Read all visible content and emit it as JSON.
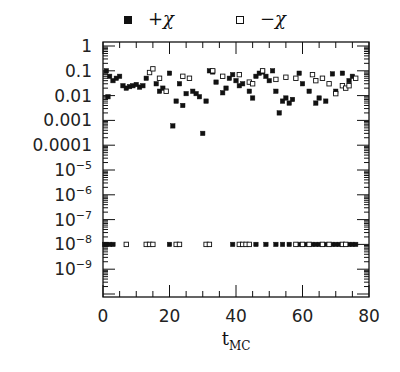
{
  "chart_data": {
    "type": "scatter",
    "title": "",
    "xlabel": "t_MC",
    "ylabel": "",
    "xlim": [
      0,
      80
    ],
    "ylim_log10": [
      -10.15,
      0.15
    ],
    "yscale": "log",
    "grid": false,
    "legend_position": "top",
    "x_ticks": [
      0,
      20,
      40,
      60,
      80
    ],
    "x_tick_labels": [
      "0",
      "20",
      "40",
      "60",
      "80"
    ],
    "y_ticks_log10": [
      0,
      -1,
      -2,
      -3,
      -4,
      -5,
      -6,
      -7,
      -8,
      -9
    ],
    "y_tick_labels": [
      "1",
      "0.1",
      "0.01",
      "0.001",
      "0.0001",
      "10^-5",
      "10^-6",
      "10^-7",
      "10^-8",
      "10^-9"
    ],
    "series": [
      {
        "name": "+χ",
        "marker": "filled-square",
        "points": [
          [
            1,
            0.1
          ],
          [
            1.5,
            0.009
          ],
          [
            2,
            0.06
          ],
          [
            3,
            0.04
          ],
          [
            4,
            0.05
          ],
          [
            5,
            0.06
          ],
          [
            6,
            0.025
          ],
          [
            7,
            0.02
          ],
          [
            8,
            0.023
          ],
          [
            9,
            0.025
          ],
          [
            10,
            0.028
          ],
          [
            11,
            0.022
          ],
          [
            12,
            0.025
          ],
          [
            13,
            0.05
          ],
          [
            16,
            0.03
          ],
          [
            17,
            0.015
          ],
          [
            18,
            0.02
          ],
          [
            20,
            0.08
          ],
          [
            21,
            0.0006
          ],
          [
            22,
            0.006
          ],
          [
            23,
            0.03
          ],
          [
            24,
            0.004
          ],
          [
            25,
            0.012
          ],
          [
            27,
            0.015
          ],
          [
            28,
            0.012
          ],
          [
            29,
            0.009
          ],
          [
            30,
            0.0003
          ],
          [
            31,
            0.006
          ],
          [
            32,
            0.1
          ],
          [
            33,
            0.09
          ],
          [
            34,
            0.035
          ],
          [
            36,
            0.013
          ],
          [
            37,
            0.02
          ],
          [
            38,
            0.05
          ],
          [
            39,
            0.07
          ],
          [
            40,
            0.04
          ],
          [
            41,
            0.025
          ],
          [
            42,
            0.03
          ],
          [
            44,
            0.015
          ],
          [
            45,
            0.008
          ],
          [
            46,
            0.06
          ],
          [
            47,
            0.08
          ],
          [
            48,
            0.09
          ],
          [
            49,
            0.06
          ],
          [
            50,
            0.04
          ],
          [
            51,
            0.1
          ],
          [
            52,
            0.015
          ],
          [
            53,
            0.002
          ],
          [
            54,
            0.006
          ],
          [
            55,
            0.008
          ],
          [
            56,
            0.005
          ],
          [
            57,
            0.007
          ],
          [
            59,
            0.08
          ],
          [
            60,
            0.03
          ],
          [
            62,
            0.015
          ],
          [
            64,
            0.005
          ],
          [
            65,
            0.008
          ],
          [
            67,
            0.006
          ],
          [
            69,
            0.075
          ],
          [
            70,
            0.015
          ],
          [
            72,
            0.08
          ],
          [
            74,
            0.04
          ],
          [
            75,
            0.06
          ]
        ],
        "points_low": [
          [
            0.5,
            1e-08
          ],
          [
            1,
            1e-08
          ],
          [
            2,
            1e-08
          ],
          [
            3,
            1e-08
          ],
          [
            20,
            1e-08
          ],
          [
            39,
            1e-08
          ],
          [
            46,
            1e-08
          ],
          [
            49,
            1e-08
          ],
          [
            52,
            1e-08
          ],
          [
            54,
            1e-08
          ],
          [
            56,
            1e-08
          ],
          [
            59,
            1e-08
          ],
          [
            61,
            1e-08
          ],
          [
            63,
            1e-08
          ],
          [
            64,
            1e-08
          ],
          [
            65,
            1e-08
          ],
          [
            67,
            1e-08
          ],
          [
            69,
            1e-08
          ],
          [
            70,
            1e-08
          ],
          [
            71,
            1e-08
          ],
          [
            74,
            1e-08
          ],
          [
            75,
            1e-08
          ],
          [
            76,
            1e-08
          ]
        ]
      },
      {
        "name": "−χ",
        "marker": "open-square",
        "points": [
          [
            14,
            0.085
          ],
          [
            15,
            0.12
          ],
          [
            17,
            0.05
          ],
          [
            19,
            0.015
          ],
          [
            24,
            0.06
          ],
          [
            26,
            0.05
          ],
          [
            33,
            0.1
          ],
          [
            36,
            0.06
          ],
          [
            41,
            0.07
          ],
          [
            44,
            0.035
          ],
          [
            45,
            0.03
          ],
          [
            48,
            0.1
          ],
          [
            52,
            0.045
          ],
          [
            55,
            0.055
          ],
          [
            58,
            0.05
          ],
          [
            63,
            0.07
          ],
          [
            64,
            0.04
          ],
          [
            66,
            0.05
          ],
          [
            68,
            0.03
          ],
          [
            70,
            0.012
          ],
          [
            72,
            0.025
          ],
          [
            73,
            0.02
          ],
          [
            74,
            0.025
          ],
          [
            76,
            0.05
          ]
        ],
        "points_low": [
          [
            7,
            1e-08
          ],
          [
            13,
            1e-08
          ],
          [
            14,
            1e-08
          ],
          [
            15,
            1e-08
          ],
          [
            22,
            1e-08
          ],
          [
            23,
            1e-08
          ],
          [
            31,
            1e-08
          ],
          [
            32,
            1e-08
          ],
          [
            41,
            1e-08
          ],
          [
            42,
            1e-08
          ],
          [
            43,
            1e-08
          ],
          [
            44,
            1e-08
          ],
          [
            58,
            1e-08
          ],
          [
            60,
            1e-08
          ],
          [
            62,
            1e-08
          ],
          [
            66,
            1e-08
          ],
          [
            68,
            1e-08
          ],
          [
            72,
            1e-08
          ],
          [
            73,
            1e-08
          ]
        ]
      }
    ]
  },
  "legend": {
    "items": [
      {
        "label": "+χ",
        "marker": "filled-square"
      },
      {
        "label": "−χ",
        "marker": "open-square"
      }
    ]
  },
  "axes": {
    "x_title": "t",
    "x_title_sub": "MC"
  },
  "colors": {
    "ink": "#111111",
    "background": "#ffffff"
  }
}
